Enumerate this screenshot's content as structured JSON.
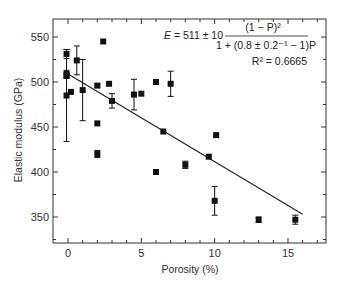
{
  "chart_data": {
    "type": "scatter",
    "title": "",
    "xlabel": "Porosity (%)",
    "ylabel": "Elastic modulus (GPa)",
    "xlim": [
      -1,
      17.5
    ],
    "ylim": [
      320,
      570
    ],
    "xticks": [
      0,
      5,
      10,
      15
    ],
    "yticks": [
      350,
      400,
      450,
      500,
      550
    ],
    "x_minor_step": 1,
    "y_minor_step": 25,
    "grid": false,
    "legend": null,
    "series": [
      {
        "name": "Measured elastic modulus",
        "marker": "square",
        "color": "#111111",
        "points": [
          {
            "x": -0.1,
            "y": 531,
            "err": 5
          },
          {
            "x": -0.1,
            "y": 509,
            "err": 4
          },
          {
            "x": -0.1,
            "y": 507,
            "err": 3
          },
          {
            "x": -0.1,
            "y": 485,
            "err": 51
          },
          {
            "x": 0.2,
            "y": 489,
            "err": 0
          },
          {
            "x": 0.6,
            "y": 524,
            "err": 16
          },
          {
            "x": 1.0,
            "y": 491,
            "err": 34
          },
          {
            "x": 2.0,
            "y": 496,
            "err": 2
          },
          {
            "x": 2.0,
            "y": 420,
            "err": 4
          },
          {
            "x": 2.0,
            "y": 454,
            "err": 0
          },
          {
            "x": 2.4,
            "y": 545,
            "err": 0
          },
          {
            "x": 2.8,
            "y": 498,
            "err": 0
          },
          {
            "x": 3.0,
            "y": 479,
            "err": 8
          },
          {
            "x": 4.5,
            "y": 486,
            "err": 17
          },
          {
            "x": 5.0,
            "y": 487,
            "err": 0
          },
          {
            "x": 6.0,
            "y": 500,
            "err": 0
          },
          {
            "x": 6.0,
            "y": 400,
            "err": 0
          },
          {
            "x": 6.5,
            "y": 445,
            "err": 0
          },
          {
            "x": 7.0,
            "y": 498,
            "err": 14
          },
          {
            "x": 8.0,
            "y": 408,
            "err": 4
          },
          {
            "x": 9.6,
            "y": 417,
            "err": 0
          },
          {
            "x": 10.0,
            "y": 368,
            "err": 16
          },
          {
            "x": 10.1,
            "y": 441,
            "err": 0
          },
          {
            "x": 13.0,
            "y": 347,
            "err": 3
          },
          {
            "x": 15.5,
            "y": 347,
            "err": 5
          }
        ]
      },
      {
        "name": "Fit",
        "type": "line",
        "color": "#222222",
        "points": [
          {
            "x": 0,
            "y": 509
          },
          {
            "x": 16.0,
            "y": 353
          }
        ]
      }
    ],
    "annotations": {
      "equation_lhs": "E = 511 ± 10",
      "equation_numerator": "(1 − P)²",
      "equation_denominator": "1 + (0.8 ± 0.2⁻¹ − 1)P",
      "r_squared": "R² = 0.6665"
    }
  },
  "labels": {
    "xlabel": "Porosity (%)",
    "ylabel": "Elastic modulus (GPa)"
  }
}
